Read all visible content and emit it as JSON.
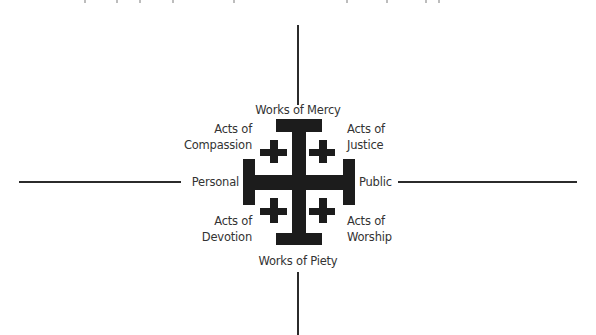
{
  "diagram": {
    "type": "jerusalem-cross-quadrant",
    "axes": {
      "top": "Works of Mercy",
      "bottom": "Works of Piety",
      "left": "Personal",
      "right": "Public"
    },
    "quadrants": {
      "top_left": {
        "line1": "Acts of",
        "line2": "Compassion"
      },
      "top_right": {
        "line1": "Acts of",
        "line2": "Justice"
      },
      "bottom_left": {
        "line1": "Acts of",
        "line2": "Devotion"
      },
      "bottom_right": {
        "line1": "Acts of",
        "line2": "Worship"
      }
    },
    "colors": {
      "cross": "#1c1c1c",
      "axis_line": "#2b2b2b",
      "text": "#333333",
      "background": "#ffffff"
    }
  }
}
